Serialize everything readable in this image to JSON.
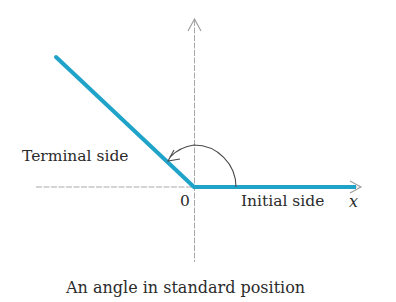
{
  "figure": {
    "caption": "An angle in standard position",
    "labels": {
      "terminal_side": "Terminal side",
      "initial_side": "Initial side",
      "origin": "0",
      "x_axis": "x"
    },
    "colors": {
      "ray": "#1fa3c9",
      "axis": "#9a9a9a",
      "arc": "#4a4a4a",
      "text": "#2b2b2b",
      "background": "#ffffff"
    },
    "geometry": {
      "origin": [
        194,
        187
      ],
      "terminal_ray_end": [
        56,
        57
      ],
      "initial_ray_end": [
        356,
        187
      ],
      "angle_degrees_approx": 137
    }
  }
}
